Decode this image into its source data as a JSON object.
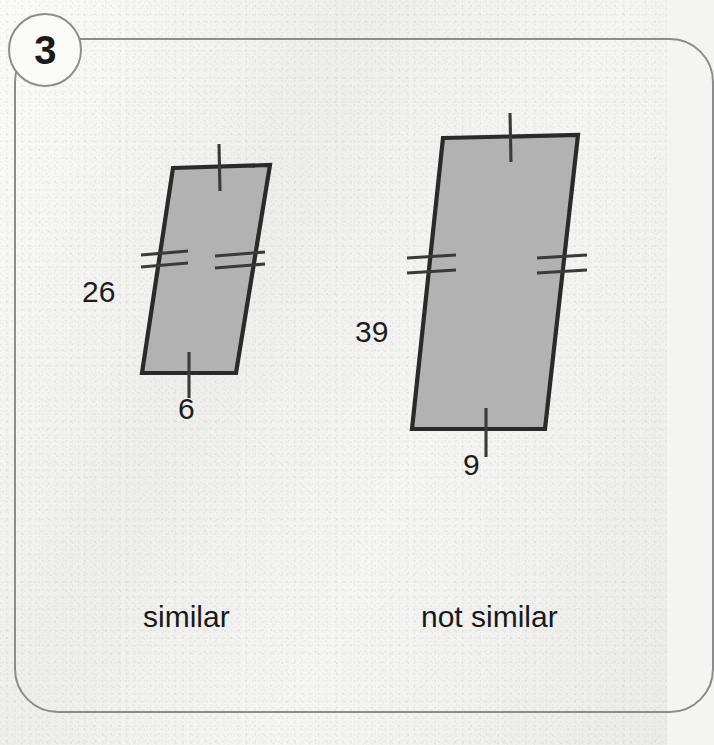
{
  "problem": {
    "number": "3",
    "badge_icon": "circle-number-badge"
  },
  "figures": [
    {
      "id": "left-quadrilateral",
      "name": "left-quadrilateral",
      "fill_color": "#b2b2b2",
      "stroke_color": "#2a2a2a",
      "vertices": [
        [
          173,
          168
        ],
        [
          270,
          165
        ],
        [
          236,
          373
        ],
        [
          142,
          373
        ]
      ],
      "labels": {
        "side": "26",
        "base": "6"
      },
      "tick_marks": {
        "top": 1,
        "bottom": 1,
        "left": 2,
        "right": 2
      },
      "caption": "similar"
    },
    {
      "id": "right-quadrilateral",
      "name": "right-quadrilateral",
      "fill_color": "#b2b2b2",
      "stroke_color": "#2a2a2a",
      "vertices": [
        [
          443,
          138
        ],
        [
          578,
          135
        ],
        [
          545,
          429
        ],
        [
          412,
          429
        ]
      ],
      "labels": {
        "side": "39",
        "base": "9"
      },
      "tick_marks": {
        "top": 1,
        "bottom": 1,
        "left": 2,
        "right": 2
      },
      "caption": "not similar"
    }
  ],
  "captions": {
    "left": "similar",
    "right": "not similar"
  },
  "colors": {
    "page_background": "#f3f3f1",
    "frame_border": "#8c8c8c",
    "shape_fill": "#b2b2b2",
    "shape_outline": "#2a2a2a",
    "text": "#1d1d1d"
  }
}
